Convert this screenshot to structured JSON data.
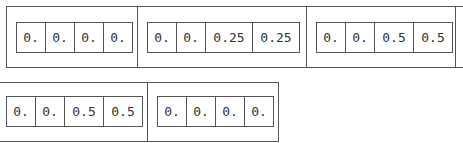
{
  "rows": [
    {
      "groups": [
        {
          "values": [
            "0.",
            "0.",
            "0.",
            "0."
          ]
        },
        {
          "values": [
            "0.",
            "0.",
            "0.25",
            "0.25"
          ]
        },
        {
          "values": [
            "0.",
            "0.",
            "0.5",
            "0.5"
          ]
        }
      ]
    },
    {
      "groups": [
        {
          "values": [
            "0.",
            "0.",
            "0.5",
            "0.5"
          ]
        },
        {
          "values": [
            "0.",
            "0.",
            "0.",
            "0."
          ]
        }
      ]
    }
  ]
}
